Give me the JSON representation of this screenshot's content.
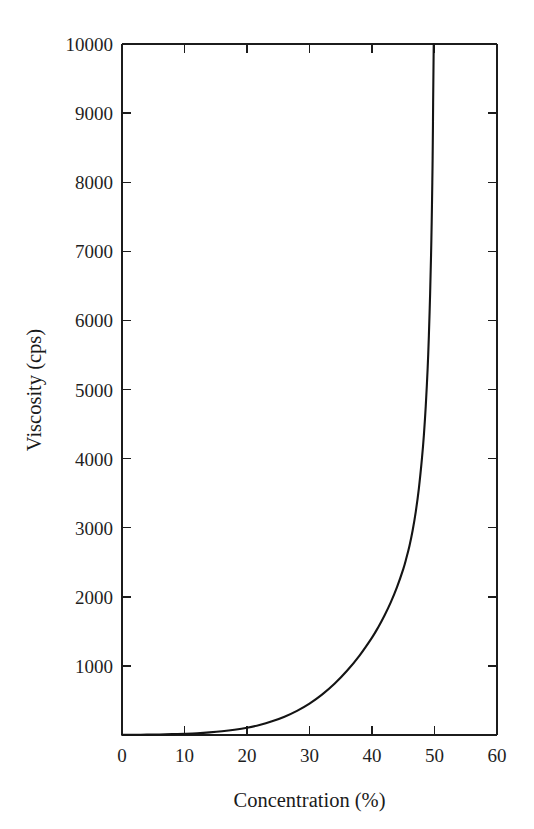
{
  "chart_data": {
    "type": "line",
    "title": "",
    "xlabel": "Concentration (%)",
    "ylabel": "Viscosity (cps)",
    "xlim": [
      0,
      60
    ],
    "ylim": [
      0,
      10000
    ],
    "grid": false,
    "legend": null,
    "x_ticks": [
      "0",
      "10",
      "20",
      "30",
      "40",
      "50",
      "60"
    ],
    "x_tick_values": [
      0,
      10,
      20,
      30,
      40,
      50,
      60
    ],
    "y_ticks": [
      "1000",
      "2000",
      "3000",
      "4000",
      "5000",
      "6000",
      "7000",
      "8000",
      "9000",
      "10000"
    ],
    "y_tick_values": [
      1000,
      2000,
      3000,
      4000,
      5000,
      6000,
      7000,
      8000,
      9000,
      10000
    ],
    "series": [
      {
        "name": "Viscosity vs Concentration",
        "color": "#141414",
        "x": [
          0,
          2,
          4,
          6,
          8,
          10,
          12,
          14,
          16,
          18,
          20,
          22,
          24,
          26,
          28,
          30,
          32,
          34,
          36,
          38,
          40,
          41,
          42,
          43,
          44,
          45,
          45.5,
          46,
          46.5,
          47,
          47.5,
          48,
          48.3,
          48.6,
          48.9,
          49.1,
          49.3,
          49.45,
          49.55,
          49.65,
          49.7,
          49.75,
          49.78
        ],
        "y": [
          2,
          3,
          5,
          8,
          12,
          18,
          26,
          38,
          54,
          76,
          105,
          145,
          198,
          265,
          350,
          455,
          585,
          742,
          930,
          1150,
          1410,
          1560,
          1730,
          1920,
          2140,
          2400,
          2560,
          2740,
          2960,
          3230,
          3570,
          4010,
          4340,
          4760,
          5300,
          5780,
          6390,
          6950,
          7420,
          8000,
          8350,
          8800,
          9150
        ]
      }
    ],
    "annotations": [],
    "axis_color": "#1c1c1c",
    "background": "#ffffff"
  },
  "figure": {
    "plot_left_px": 122,
    "plot_right_px": 497,
    "plot_top_px": 44,
    "plot_bottom_px": 735
  }
}
